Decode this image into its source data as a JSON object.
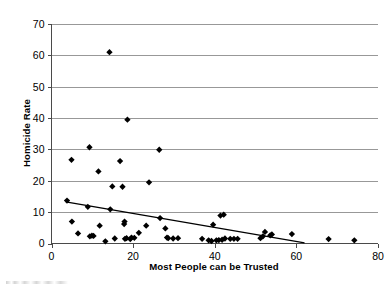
{
  "chart_data": {
    "type": "scatter",
    "title": "",
    "subtitle": "",
    "xlabel": "Most People can be Trusted",
    "ylabel": "Homicide Rate",
    "xlim": [
      0,
      80
    ],
    "ylim": [
      0,
      70
    ],
    "xticks": [
      0,
      20,
      40,
      60,
      80
    ],
    "yticks": [
      0,
      10,
      20,
      30,
      40,
      50,
      60,
      70
    ],
    "xtick_labels": [
      "0",
      "20",
      "40",
      "60",
      "80"
    ],
    "ytick_labels": [
      "0",
      "10",
      "20",
      "30",
      "40",
      "50",
      "60",
      "70"
    ],
    "grid": "horizontal",
    "legend": "none",
    "marker": "filled-diamond",
    "marker_color": "#000000",
    "series": [
      {
        "name": "Countries",
        "points": [
          [
            3.8,
            13.7
          ],
          [
            4.9,
            26.7
          ],
          [
            5.0,
            7.0
          ],
          [
            6.5,
            3.2
          ],
          [
            8.9,
            11.7
          ],
          [
            9.3,
            30.7
          ],
          [
            9.4,
            2.3
          ],
          [
            9.9,
            2.5
          ],
          [
            10.3,
            2.4
          ],
          [
            11.5,
            23.0
          ],
          [
            11.8,
            5.7
          ],
          [
            13.2,
            0.7
          ],
          [
            14.2,
            61.0
          ],
          [
            14.4,
            10.9
          ],
          [
            14.9,
            18.2
          ],
          [
            15.5,
            1.6
          ],
          [
            16.8,
            26.3
          ],
          [
            17.4,
            18.1
          ],
          [
            17.8,
            6.2
          ],
          [
            17.9,
            7.0
          ],
          [
            18.0,
            1.5
          ],
          [
            18.4,
            1.7
          ],
          [
            18.6,
            39.5
          ],
          [
            19.3,
            1.4
          ],
          [
            19.6,
            1.9
          ],
          [
            20.3,
            1.8
          ],
          [
            21.4,
            3.4
          ],
          [
            23.2,
            5.7
          ],
          [
            23.9,
            19.5
          ],
          [
            26.4,
            29.9
          ],
          [
            26.6,
            8.1
          ],
          [
            27.9,
            4.8
          ],
          [
            28.3,
            1.9
          ],
          [
            28.6,
            1.7
          ],
          [
            29.8,
            1.6
          ],
          [
            31.0,
            1.7
          ],
          [
            36.9,
            1.5
          ],
          [
            38.5,
            1.0
          ],
          [
            39.2,
            0.8
          ],
          [
            39.6,
            6.0
          ],
          [
            40.4,
            1.0
          ],
          [
            41.0,
            1.1
          ],
          [
            41.4,
            8.9
          ],
          [
            41.8,
            1.2
          ],
          [
            42.2,
            9.2
          ],
          [
            42.5,
            1.6
          ],
          [
            43.8,
            1.5
          ],
          [
            44.7,
            1.5
          ],
          [
            45.6,
            1.5
          ],
          [
            51.2,
            1.7
          ],
          [
            51.8,
            2.3
          ],
          [
            52.3,
            3.7
          ],
          [
            53.6,
            2.6
          ],
          [
            54.0,
            2.9
          ],
          [
            58.9,
            3.0
          ],
          [
            67.9,
            1.4
          ],
          [
            74.2,
            1.0
          ]
        ]
      }
    ],
    "trendline": {
      "name": "linear-fit",
      "x_start": 3.5,
      "y_start": 13.3,
      "x_end": 62.0,
      "y_end": 0.2
    }
  }
}
